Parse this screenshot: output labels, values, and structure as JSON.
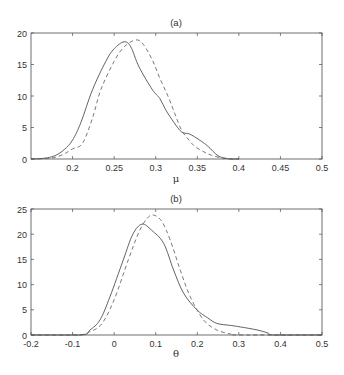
{
  "chart_data": [
    {
      "type": "line",
      "title": "(a)",
      "xlabel": "μ",
      "ylabel": "",
      "xlim": [
        0.15,
        0.5
      ],
      "ylim": [
        0,
        20
      ],
      "xticks": [
        0.2,
        0.25,
        0.3,
        0.35,
        0.4,
        0.45,
        0.5
      ],
      "xtick_labels": [
        "0.2",
        "0.25",
        "0.3",
        "0.35",
        "0.4",
        "0.45",
        "0.5"
      ],
      "yticks": [
        0,
        5,
        10,
        15,
        20
      ],
      "ytick_labels": [
        "0",
        "5",
        "10",
        "15",
        "20"
      ],
      "grid": false,
      "legend": null,
      "series": [
        {
          "name": "solid",
          "style": "solid",
          "x": [
            0.15,
            0.16,
            0.17,
            0.18,
            0.19,
            0.2,
            0.21,
            0.224,
            0.24,
            0.25,
            0.262,
            0.27,
            0.28,
            0.296,
            0.305,
            0.312,
            0.322,
            0.331,
            0.34,
            0.347,
            0.355,
            0.363,
            0.375,
            0.385,
            0.39,
            0.4
          ],
          "y": [
            0,
            0.05,
            0.2,
            0.6,
            1.5,
            3.0,
            5.8,
            11.0,
            15.5,
            17.5,
            18.6,
            17.8,
            14.6,
            11.0,
            9.6,
            7.8,
            5.8,
            4.3,
            4.0,
            3.5,
            2.8,
            2.0,
            0.5,
            0.1,
            0,
            0
          ]
        },
        {
          "name": "dashed",
          "style": "dashed",
          "x": [
            0.15,
            0.17,
            0.18,
            0.19,
            0.2,
            0.212,
            0.224,
            0.234,
            0.25,
            0.262,
            0.276,
            0.285,
            0.296,
            0.305,
            0.315,
            0.323,
            0.331,
            0.34,
            0.347,
            0.357,
            0.367,
            0.38,
            0.39,
            0.4
          ],
          "y": [
            0,
            0.1,
            0.3,
            0.8,
            1.6,
            2.5,
            6.5,
            11.0,
            15.5,
            17.8,
            18.9,
            18.2,
            15.7,
            12.8,
            9.9,
            7.2,
            4.6,
            3.0,
            2.0,
            1.2,
            0.6,
            0.15,
            0.02,
            0
          ]
        }
      ]
    },
    {
      "type": "line",
      "title": "(b)",
      "xlabel": "θ",
      "ylabel": "",
      "xlim": [
        -0.2,
        0.5
      ],
      "ylim": [
        0,
        25
      ],
      "xticks": [
        -0.2,
        -0.1,
        0,
        0.1,
        0.2,
        0.3,
        0.4,
        0.5
      ],
      "xtick_labels": [
        "-0.2",
        "-0.1",
        "0",
        "0.1",
        "0.2",
        "0.3",
        "0.4",
        "0.5"
      ],
      "yticks": [
        0,
        5,
        10,
        15,
        20,
        25
      ],
      "ytick_labels": [
        "0",
        "5",
        "10",
        "15",
        "20",
        "25"
      ],
      "grid": false,
      "legend": null,
      "series": [
        {
          "name": "solid",
          "style": "solid",
          "x": [
            -0.2,
            -0.08,
            -0.058,
            -0.034,
            -0.01,
            0.022,
            0.045,
            0.067,
            0.09,
            0.119,
            0.143,
            0.167,
            0.199,
            0.225,
            0.247,
            0.28,
            0.304,
            0.344,
            0.37,
            0.384,
            0.5
          ],
          "y": [
            0,
            0,
            1.0,
            3.0,
            7.6,
            14.9,
            20.0,
            22.0,
            20.8,
            18.2,
            12.9,
            8.3,
            5.0,
            3.4,
            2.3,
            1.9,
            1.6,
            1.0,
            0.4,
            0,
            0
          ]
        },
        {
          "name": "dashed",
          "style": "dashed",
          "x": [
            -0.2,
            -0.09,
            -0.06,
            -0.03,
            0.0,
            0.034,
            0.06,
            0.08,
            0.095,
            0.115,
            0.135,
            0.159,
            0.183,
            0.215,
            0.247,
            0.28,
            0.3,
            0.5
          ],
          "y": [
            0,
            0,
            0.6,
            2.2,
            7.0,
            14.9,
            20.5,
            23.2,
            23.8,
            22.5,
            18.8,
            12.9,
            7.6,
            3.0,
            1.0,
            0.2,
            0,
            0
          ]
        }
      ]
    }
  ],
  "panels": {
    "a": {
      "title": "(a)",
      "xlabel": "μ"
    },
    "b": {
      "title": "(b)",
      "xlabel": "θ"
    }
  }
}
